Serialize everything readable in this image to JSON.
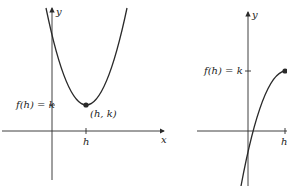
{
  "graphs": [
    {
      "id": "left",
      "description": "Upward parabola with minimum at vertex (h, k)",
      "x_axis_label": "x",
      "y_axis_label": "y",
      "tick_x_label": "h",
      "tick_y_label": "f(h) = k",
      "point_label": "(h, k)"
    },
    {
      "id": "right",
      "description": "Increasing concave-down curve ending at point (h, f(h))",
      "y_axis_label": "y",
      "tick_x_label": "h",
      "tick_y_label": "f(h) = k"
    }
  ],
  "colors": {
    "line": "#2a2a2a",
    "point": "#2a2a2a",
    "background": "#ffffff"
  }
}
